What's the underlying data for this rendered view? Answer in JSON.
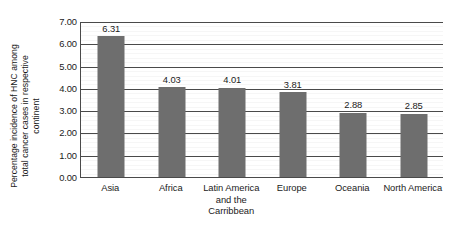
{
  "chart_data": {
    "type": "bar",
    "title": "",
    "xlabel": "",
    "ylabel": "Percentage incidence of HNC among total cancer cases in respective continent",
    "ylabel_lines": [
      "Percentage incidence of HNC among",
      "total cancer cases in respective",
      "continent"
    ],
    "categories": [
      "Asia",
      "Latin America and the Carribbean",
      "Africa",
      "Europe",
      "Oceania",
      "North America"
    ],
    "category_lines": [
      [
        "Asia"
      ],
      [
        "Africa"
      ],
      [
        "Latin America",
        "and the",
        "Carribbean"
      ],
      [
        "Europe"
      ],
      [
        "Oceania"
      ],
      [
        "North America"
      ]
    ],
    "categories_ordered": [
      "Asia",
      "Africa",
      "Latin America and the Carribbean",
      "Europe",
      "Oceania",
      "North America"
    ],
    "values": [
      6.31,
      4.03,
      4.01,
      3.81,
      2.88,
      2.85
    ],
    "value_labels": [
      "6.31",
      "4.03",
      "4.01",
      "3.81",
      "2.88",
      "2.85"
    ],
    "ylim": [
      0,
      7
    ],
    "ytick_step": 1,
    "yticks": [
      0,
      1,
      2,
      3,
      4,
      5,
      6,
      7
    ],
    "ytick_labels": [
      "0.00",
      "1.00",
      "2.00",
      "3.00",
      "4.00",
      "5.00",
      "6.00",
      "7.00"
    ],
    "grid": true,
    "legend": "none",
    "colors": {
      "bar": "#6e6e6e",
      "grid": "#4a4a4a",
      "axis": "#4a4a4a",
      "text": "#1b1b1b",
      "background": "#ffffff"
    }
  }
}
